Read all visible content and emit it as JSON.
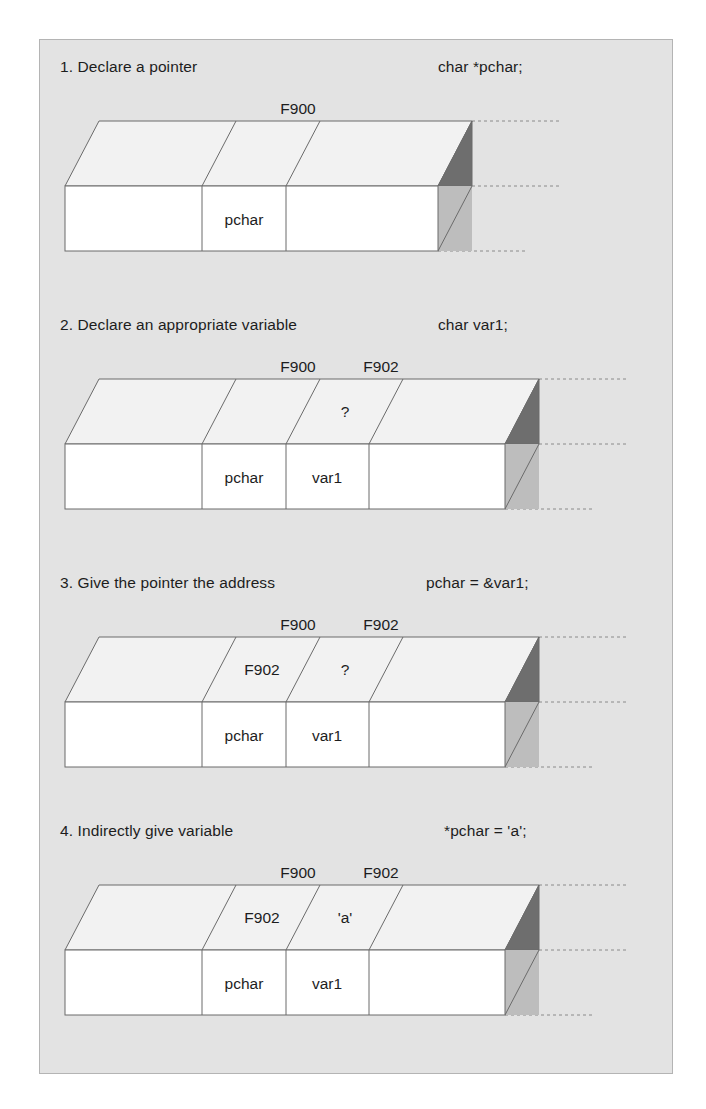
{
  "figure": {
    "background_color": "#e3e3e3",
    "border_color": "#b4b4b4"
  },
  "colors": {
    "top_face": "#f2f2f2",
    "front_face": "#ffffff",
    "end_cap_top": "#6e6e6e",
    "end_cap_side": "#bdbdbd",
    "stroke": "#6b6b6b",
    "dashed": "#8a8a8a",
    "text": "#1d1d1d"
  },
  "panels": [
    {
      "id": "panel-1",
      "step_number": "1.",
      "title": "1. Declare a pointer",
      "code": "char *pchar;",
      "address_labels": [
        {
          "text": "F900",
          "x": 296
        }
      ],
      "top_cells": [
        {
          "text": "",
          "index": 0
        },
        {
          "text": "",
          "index": 1
        },
        {
          "text": "",
          "index": 2
        }
      ],
      "front_cells": [
        {
          "text": "",
          "index": 0
        },
        {
          "text": "pchar",
          "index": 1
        },
        {
          "text": "",
          "index": 2
        }
      ],
      "cell_count": 3
    },
    {
      "id": "panel-2",
      "step_number": "2.",
      "title": "2. Declare an appropriate variable",
      "code": "char var1;",
      "address_labels": [
        {
          "text": "F900",
          "x": 296
        },
        {
          "text": "F902",
          "x": 379
        }
      ],
      "top_cells": [
        {
          "text": "",
          "index": 0
        },
        {
          "text": "",
          "index": 1
        },
        {
          "text": "?",
          "index": 2
        },
        {
          "text": "",
          "index": 3
        }
      ],
      "front_cells": [
        {
          "text": "",
          "index": 0
        },
        {
          "text": "pchar",
          "index": 1
        },
        {
          "text": "var1",
          "index": 2
        },
        {
          "text": "",
          "index": 3
        }
      ],
      "cell_count": 4
    },
    {
      "id": "panel-3",
      "step_number": "3.",
      "title": "3. Give the pointer the address",
      "code": "pchar = &var1;",
      "address_labels": [
        {
          "text": "F900",
          "x": 296
        },
        {
          "text": "F902",
          "x": 379
        }
      ],
      "top_cells": [
        {
          "text": "",
          "index": 0
        },
        {
          "text": "F902",
          "index": 1
        },
        {
          "text": "?",
          "index": 2
        },
        {
          "text": "",
          "index": 3
        }
      ],
      "front_cells": [
        {
          "text": "",
          "index": 0
        },
        {
          "text": "pchar",
          "index": 1
        },
        {
          "text": "var1",
          "index": 2
        },
        {
          "text": "",
          "index": 3
        }
      ],
      "cell_count": 4
    },
    {
      "id": "panel-4",
      "step_number": "4.",
      "title": "4. Indirectly give variable",
      "code": "*pchar = 'a';",
      "address_labels": [
        {
          "text": "F900",
          "x": 296
        },
        {
          "text": "F902",
          "x": 379
        }
      ],
      "top_cells": [
        {
          "text": "",
          "index": 0
        },
        {
          "text": "F902",
          "index": 1
        },
        {
          "text": "'a'",
          "index": 2
        },
        {
          "text": "",
          "index": 3
        }
      ],
      "front_cells": [
        {
          "text": "",
          "index": 0
        },
        {
          "text": "pchar",
          "index": 1
        },
        {
          "text": "var1",
          "index": 2
        },
        {
          "text": "",
          "index": 3
        }
      ],
      "cell_count": 4
    }
  ]
}
